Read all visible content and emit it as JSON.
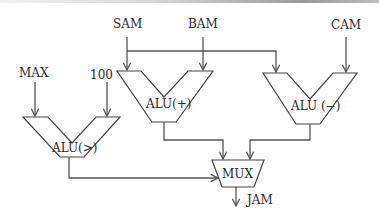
{
  "diagram": {
    "type": "datapath",
    "inputs": {
      "max": "MAX",
      "const": "100",
      "sam": "SAM",
      "bam": "BAM",
      "cam": "CAM"
    },
    "units": {
      "alu_gt": "ALU(>)",
      "alu_plus": "ALU(+)",
      "alu_minus": "ALU (−)",
      "mux": "MUX"
    },
    "output": "JAM",
    "colors": {
      "line": "#555555",
      "text": "#2a2a2a",
      "background": "#ffffff"
    }
  }
}
